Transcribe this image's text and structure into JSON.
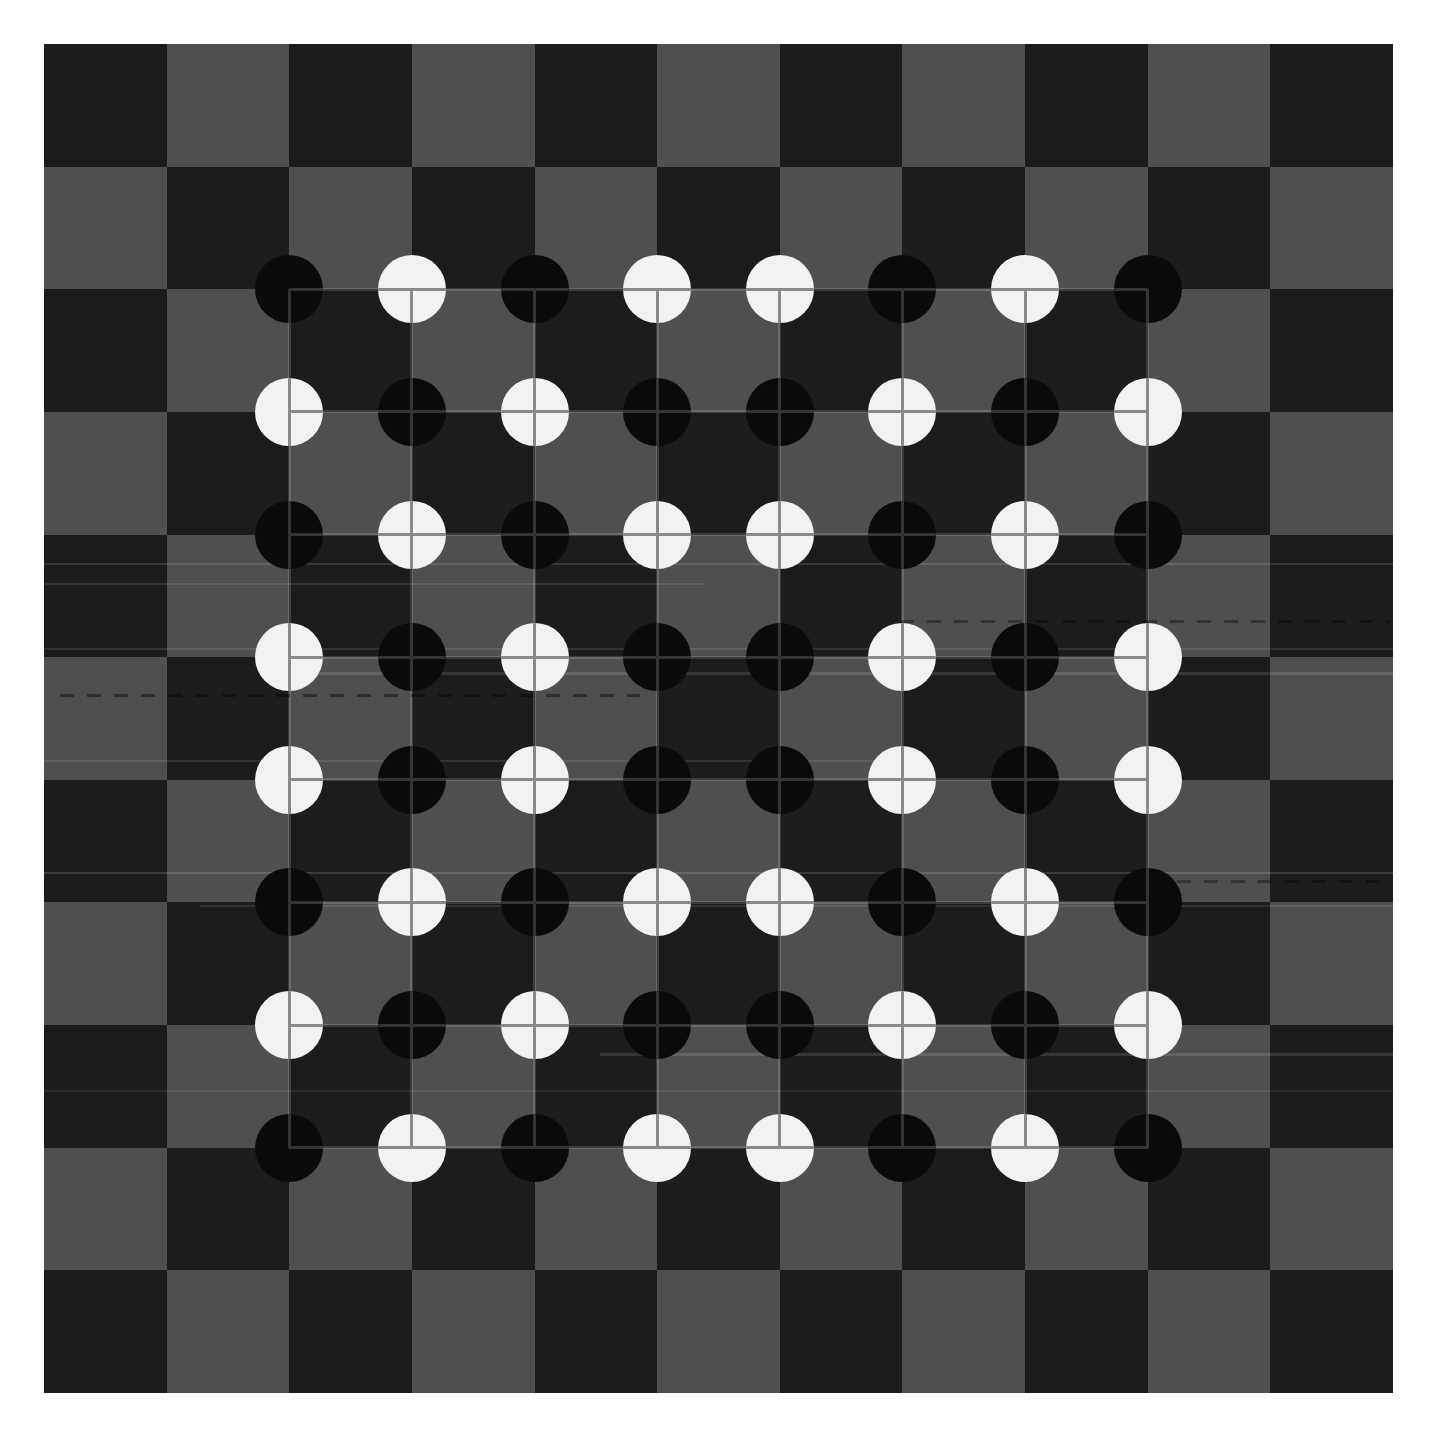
{
  "page": {
    "background_color": "#fdfdfd"
  },
  "board": {
    "columns": 11,
    "rows": 11,
    "origin_px": {
      "x": 44,
      "y": 44
    },
    "size_px": 1349,
    "top_left_square": "dark",
    "colors": {
      "dark_square": "#1c1c1c",
      "gray_square": "#4f4f4f"
    }
  },
  "inner_grid": {
    "line_color": "rgba(255,255,255,0.15)",
    "line_width_px": 3,
    "from_line_index": 2,
    "to_line_index": 9
  },
  "pieces": {
    "diameter_px": 68,
    "count_black": 32,
    "count_white": 32,
    "colors": {
      "B": "#0a0a0a",
      "W": "#f2f2f2"
    },
    "crosshair_colors": {
      "B": "#343434",
      "W": "#8a8a8a"
    },
    "rows": [
      "BWBWWBWB",
      "WBWBBWBW",
      "BWBWWBWB",
      "WBWBBWBW",
      "WBWBBWBW",
      "BWBWWBWB",
      "WBWBBWBW",
      "BWBWWBWB"
    ]
  },
  "scan_artifacts": {
    "light_streak_color": "#ffffff",
    "dark_streak_color": "#000000",
    "light_streaks": [
      {
        "y": 563,
        "x": 44,
        "w": 1349,
        "h": 2,
        "opacity": 0.12
      },
      {
        "y": 583,
        "x": 44,
        "w": 660,
        "h": 2,
        "opacity": 0.1
      },
      {
        "y": 648,
        "x": 44,
        "w": 1349,
        "h": 2,
        "opacity": 0.1
      },
      {
        "y": 672,
        "x": 300,
        "w": 1093,
        "h": 3,
        "opacity": 0.12
      },
      {
        "y": 760,
        "x": 44,
        "w": 860,
        "h": 2,
        "opacity": 0.1
      },
      {
        "y": 872,
        "x": 44,
        "w": 1349,
        "h": 2,
        "opacity": 0.14
      },
      {
        "y": 905,
        "x": 200,
        "w": 1193,
        "h": 2,
        "opacity": 0.1
      },
      {
        "y": 1053,
        "x": 600,
        "w": 793,
        "h": 3,
        "opacity": 0.12
      },
      {
        "y": 1090,
        "x": 44,
        "w": 1349,
        "h": 2,
        "opacity": 0.08
      }
    ],
    "dashed_streaks": [
      {
        "y": 620,
        "x": 900,
        "w": 490,
        "h": 3,
        "opacity": 0.35
      },
      {
        "y": 694,
        "x": 60,
        "w": 580,
        "h": 3,
        "opacity": 0.4
      },
      {
        "y": 880,
        "x": 1150,
        "w": 240,
        "h": 3,
        "opacity": 0.35
      }
    ]
  }
}
